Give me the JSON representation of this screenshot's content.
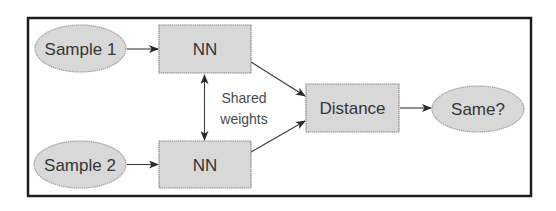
{
  "diagram": {
    "type": "flowchart",
    "title": "",
    "colors": {
      "frame_border": "#1e1e1e",
      "node_fill": "#d8d8d8",
      "node_border": "#8a8a8a",
      "text": "#353535",
      "edge": "#3a3a3a"
    },
    "nodes": [
      {
        "id": "sample1",
        "label": "Sample 1",
        "shape": "ellipse"
      },
      {
        "id": "sample2",
        "label": "Sample 2",
        "shape": "ellipse"
      },
      {
        "id": "nn1",
        "label": "NN",
        "shape": "rectangle"
      },
      {
        "id": "nn2",
        "label": "NN",
        "shape": "rectangle"
      },
      {
        "id": "distance",
        "label": "Distance",
        "shape": "rectangle"
      },
      {
        "id": "same",
        "label": "Same?",
        "shape": "ellipse"
      }
    ],
    "edges": [
      {
        "from": "sample1",
        "to": "nn1",
        "direction": "forward"
      },
      {
        "from": "sample2",
        "to": "nn2",
        "direction": "forward"
      },
      {
        "from": "nn1",
        "to": "nn2",
        "direction": "both",
        "label": "Shared weights"
      },
      {
        "from": "nn1",
        "to": "distance",
        "direction": "forward"
      },
      {
        "from": "nn2",
        "to": "distance",
        "direction": "forward"
      },
      {
        "from": "distance",
        "to": "same",
        "direction": "forward"
      }
    ],
    "annotation": {
      "line1": "Shared",
      "line2": "weights"
    }
  }
}
